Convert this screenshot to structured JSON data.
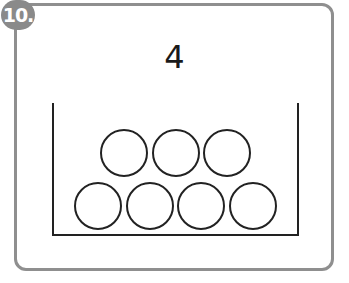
{
  "badge": {
    "label": "10."
  },
  "problem": {
    "number": "4"
  },
  "colors": {
    "frame": "#8f8f8f",
    "badge": "#8a8a8a",
    "stroke": "#222222"
  },
  "container": {
    "top_row_circles": 3,
    "bottom_row_circles": 4,
    "total_circles": 7
  }
}
